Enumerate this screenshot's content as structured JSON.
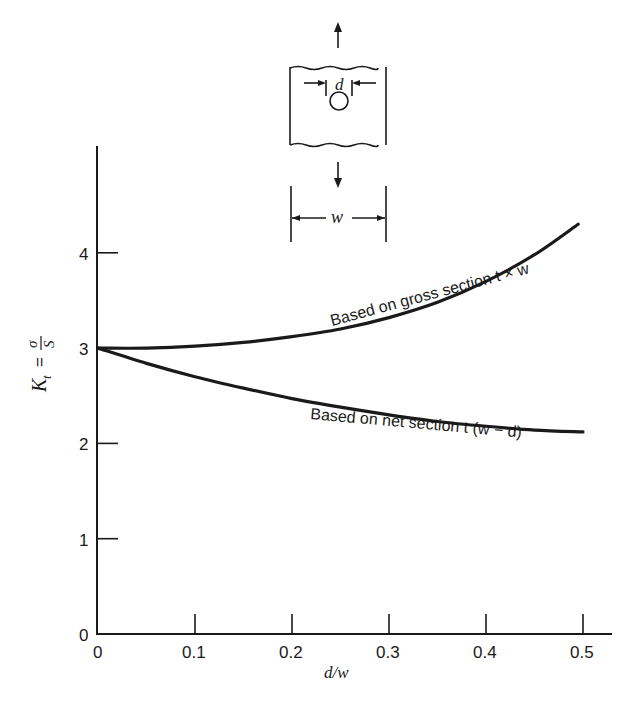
{
  "chart_data": {
    "type": "line",
    "title": "",
    "xlabel": "d/w",
    "ylabel": "K_t = σ/S",
    "xlim": [
      0,
      0.53
    ],
    "ylim": [
      0,
      5
    ],
    "x_ticks": [
      "0",
      "0.1",
      "0.2",
      "0.3",
      "0.4",
      "0.5"
    ],
    "y_ticks": [
      "0",
      "1",
      "2",
      "3",
      "4"
    ],
    "grid": false,
    "legend": "inline curve annotations",
    "series": [
      {
        "name": "Based on gross section t × w",
        "x": [
          0,
          0.05,
          0.1,
          0.15,
          0.2,
          0.25,
          0.3,
          0.35,
          0.4,
          0.45,
          0.495
        ],
        "y": [
          3.0,
          3.0,
          3.02,
          3.06,
          3.12,
          3.2,
          3.32,
          3.48,
          3.7,
          3.98,
          4.3
        ]
      },
      {
        "name": "Based on net section t (w − d)",
        "x": [
          0,
          0.05,
          0.1,
          0.15,
          0.2,
          0.25,
          0.3,
          0.35,
          0.4,
          0.45,
          0.5
        ],
        "y": [
          3.0,
          2.84,
          2.7,
          2.58,
          2.47,
          2.38,
          2.3,
          2.23,
          2.18,
          2.14,
          2.12
        ]
      }
    ]
  },
  "labels": {
    "y_axis_kt": "K",
    "y_axis_sub": "t",
    "y_axis_eq": "=",
    "y_axis_num": "σ",
    "y_axis_den": "S",
    "x_axis": "d/w",
    "gross_curve": "Based on gross section t × w",
    "net_curve": "Based on net section t (w − d)",
    "diagram_d": "d",
    "diagram_w": "w"
  }
}
